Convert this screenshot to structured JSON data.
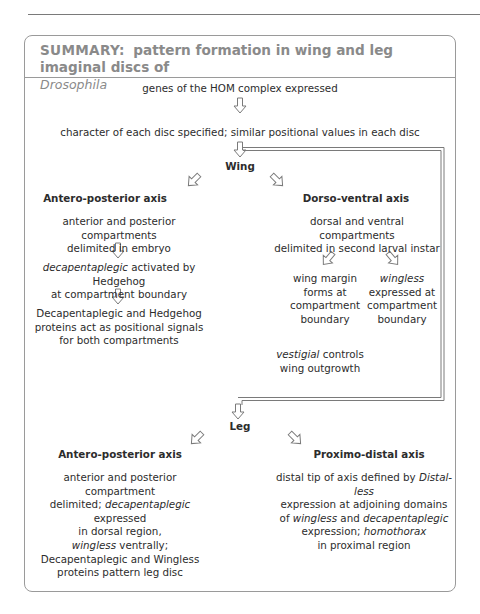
{
  "header": {
    "label": "SUMMARY:",
    "title": "pattern formation in wing and leg imaginal discs of",
    "species": "Drosophila"
  },
  "flow": {
    "step1": "genes of the HOM complex expressed",
    "step2": "character of each disc specified; similar positional values in each disc",
    "wing": {
      "title": "Wing",
      "ap": {
        "title": "Antero-posterior axis",
        "s1": [
          "anterior and posterior compartments",
          "delimited in embryo"
        ],
        "s2_italic": "decapentaplegic",
        "s2_rest": " activated by Hedgehog",
        "s2_line2": "at compartment boundary",
        "s3": [
          "Decapentaplegic and Hedgehog",
          "proteins act as positional signals",
          "for both compartments"
        ]
      },
      "dv": {
        "title": "Dorso-ventral axis",
        "s1": [
          "dorsal and ventral compartments",
          "delimited in second larval instar"
        ],
        "left": [
          "wing margin",
          "forms at",
          "compartment",
          "boundary"
        ],
        "right_italic": "wingless",
        "right": [
          "expressed at",
          "compartment",
          "boundary"
        ],
        "vest_italic": "vestigial",
        "vest_rest": " controls",
        "vest_line2": "wing outgrowth"
      }
    },
    "leg": {
      "title": "Leg",
      "ap": {
        "title": "Antero-posterior axis",
        "l1": "anterior and posterior compartment",
        "l2a": "delimited; ",
        "l2i": "decapentaplegic",
        "l2b": " expressed",
        "l3": "in dorsal region,",
        "l4i": "wingless",
        "l4b": " ventrally;",
        "l5": "Decapentaplegic and Wingless",
        "l6": "proteins pattern leg disc"
      },
      "pd": {
        "title": "Proximo-distal axis",
        "l1a": "distal tip of axis defined by ",
        "l1i": "Distal-less",
        "l2": "expression at adjoining domains",
        "l3a": "of ",
        "l3i1": "wingless",
        "l3b": " and ",
        "l3i2": "decapentaplegic",
        "l4a": "expression; ",
        "l4i": "homothorax",
        "l5": "in proximal region"
      }
    }
  },
  "colors": {
    "text": "#2c2c2c",
    "header": "#8a8a8a",
    "border": "#9a9a9a",
    "arrow": "#7a7a7a"
  }
}
